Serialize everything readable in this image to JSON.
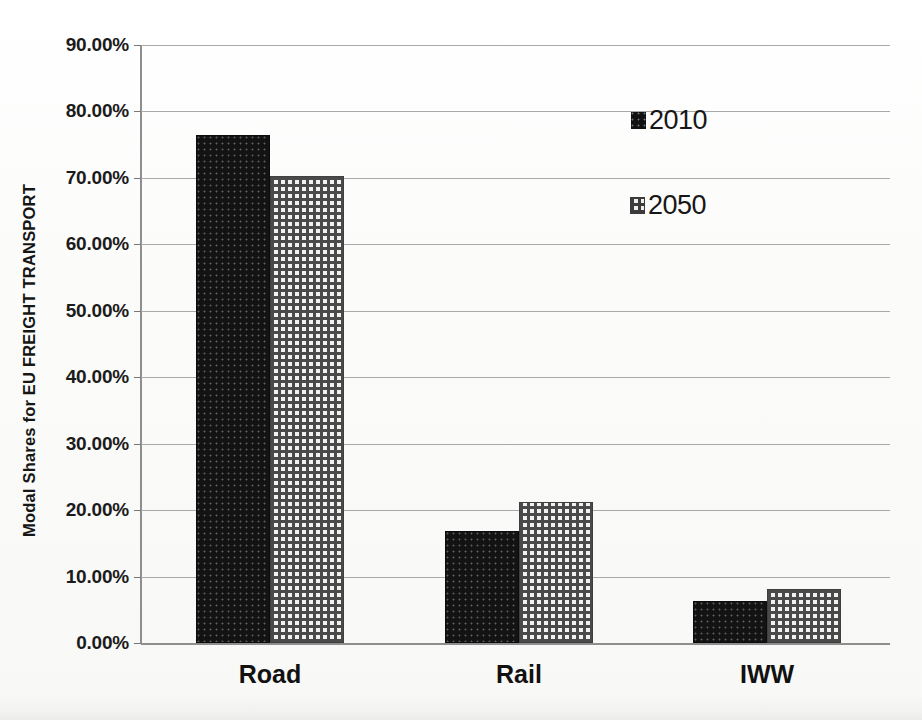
{
  "chart_data": {
    "type": "bar",
    "title": "",
    "xlabel": "",
    "ylabel": "Modal Shares  for EU  FREIGHT TRANSPORT",
    "categories": [
      "Road",
      "Rail",
      "IWW"
    ],
    "series": [
      {
        "name": "2010",
        "values": [
          76.5,
          16.8,
          6.3
        ]
      },
      {
        "name": "2050",
        "values": [
          70.3,
          21.2,
          8.2
        ]
      }
    ],
    "ylim": [
      0,
      90
    ],
    "ytick_values": [
      0,
      10,
      20,
      30,
      40,
      50,
      60,
      70,
      80,
      90
    ],
    "ytick_labels": [
      "0.00%",
      "10.00%",
      "20.00%",
      "30.00%",
      "40.00%",
      "50.00%",
      "60.00%",
      "70.00%",
      "80.00%",
      "90.00%"
    ],
    "value_format": "percent",
    "grid": true,
    "legend_position": "inside-top-right",
    "legend": [
      {
        "label": "2010",
        "swatch": "solid-black-dotted"
      },
      {
        "label": "2050",
        "swatch": "gray-checkered"
      }
    ]
  },
  "colors": {
    "series_2010": "#131313",
    "series_2050": "#f2f2f2",
    "series_2050_pattern": "#4a4a4a",
    "gridline": "#a9a9a9",
    "axis": "#8e8e8e",
    "text": "#111111",
    "background": "#fcfcfb"
  }
}
